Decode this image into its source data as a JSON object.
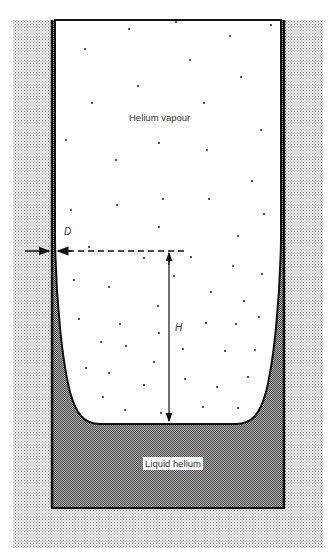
{
  "figure": {
    "type": "cross-section diagram",
    "labels": {
      "vapour": "Helium vapour",
      "liquid": "Liquid helium",
      "film_thickness": "D",
      "height": "H"
    },
    "annotations": [
      {
        "symbol": "D",
        "meaning": "film thickness at height H",
        "style": "opposing arrows with dashed guide line"
      },
      {
        "symbol": "H",
        "meaning": "height above bulk liquid surface",
        "style": "double-headed vertical arrow"
      }
    ],
    "regions": [
      {
        "name": "container-wall",
        "fill": "stippled light gray"
      },
      {
        "name": "vapour-space",
        "fill": "white with scattered dots"
      },
      {
        "name": "liquid-bulk",
        "fill": "dark crosshatch"
      },
      {
        "name": "wall-film",
        "fill": "dark crosshatch, thickening toward bottom"
      }
    ],
    "colors": {
      "wall_stipple": "#c8c8c8",
      "liquid": "#8a8a8a",
      "outline": "#111111",
      "background": "#ffffff"
    }
  }
}
